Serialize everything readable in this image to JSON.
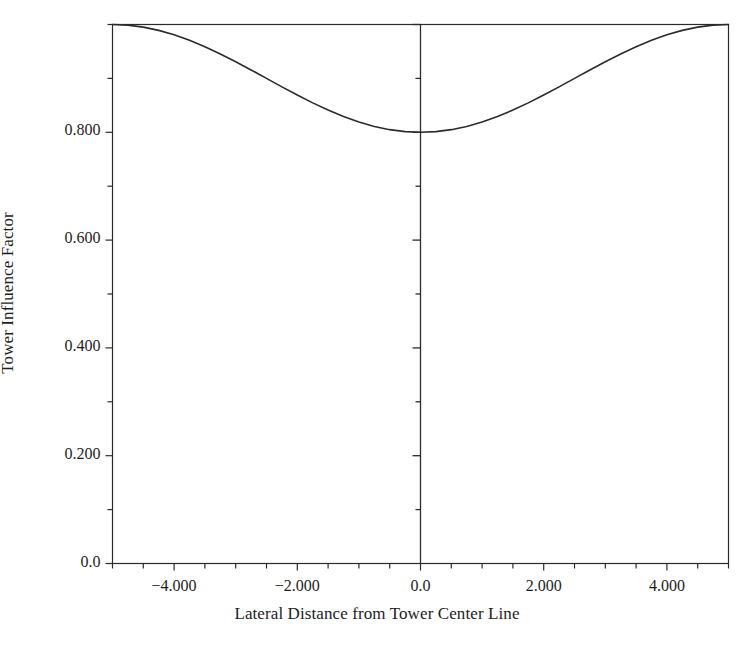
{
  "chart_data": {
    "type": "line",
    "title": "",
    "xlabel": "Lateral Distance from Tower Center Line",
    "ylabel": "Tower Influence Factor",
    "xlim": [
      -5.0,
      5.0
    ],
    "ylim": [
      0.0,
      1.0
    ],
    "grid": false,
    "legend": null,
    "xticks": [
      -5.0,
      -4.5,
      -4.0,
      -3.5,
      -3.0,
      -2.5,
      -2.0,
      -1.5,
      -1.0,
      -0.5,
      0.0,
      0.5,
      1.0,
      1.5,
      2.0,
      2.5,
      3.0,
      3.5,
      4.0,
      4.5,
      5.0
    ],
    "xtick_labels": [
      {
        "value": -4.0,
        "text": "−4.000"
      },
      {
        "value": -2.0,
        "text": "−2.000"
      },
      {
        "value": 0.0,
        "text": "0.0"
      },
      {
        "value": 2.0,
        "text": "2.000"
      },
      {
        "value": 4.0,
        "text": "4.000"
      }
    ],
    "yticks": [
      0.0,
      0.1,
      0.2,
      0.3,
      0.4,
      0.5,
      0.6,
      0.7,
      0.8,
      0.9,
      1.0
    ],
    "ytick_labels": [
      {
        "value": 0.0,
        "text": "0.0"
      },
      {
        "value": 0.2,
        "text": "0.200"
      },
      {
        "value": 0.4,
        "text": "0.400"
      },
      {
        "value": 0.6,
        "text": "0.600"
      },
      {
        "value": 0.8,
        "text": "0.800"
      }
    ],
    "series": [
      {
        "name": "Tower Influence Factor",
        "color": "#2b2b2b",
        "line_width": 1.6,
        "formula": "f(x) = 0.9 - 0.1*cos(pi*x/5)",
        "x": [
          -5.0,
          -4.75,
          -4.5,
          -4.25,
          -4.0,
          -3.75,
          -3.5,
          -3.25,
          -3.0,
          -2.75,
          -2.5,
          -2.25,
          -2.0,
          -1.75,
          -1.5,
          -1.25,
          -1.0,
          -0.75,
          -0.5,
          -0.25,
          0.0,
          0.25,
          0.5,
          0.75,
          1.0,
          1.25,
          1.5,
          1.75,
          2.0,
          2.25,
          2.5,
          2.75,
          3.0,
          3.25,
          3.5,
          3.75,
          4.0,
          4.25,
          4.5,
          4.75,
          5.0
        ],
        "y": [
          1.0,
          0.9988,
          0.9951,
          0.9891,
          0.9809,
          0.9707,
          0.9588,
          0.9454,
          0.9309,
          0.9157,
          0.9,
          0.8843,
          0.8691,
          0.8546,
          0.8412,
          0.8293,
          0.8191,
          0.8109,
          0.8049,
          0.8012,
          0.8,
          0.8012,
          0.8049,
          0.8109,
          0.8191,
          0.8293,
          0.8412,
          0.8546,
          0.8691,
          0.8843,
          0.9,
          0.9157,
          0.9309,
          0.9454,
          0.9588,
          0.9707,
          0.9809,
          0.9891,
          0.9951,
          0.9988,
          1.0
        ]
      }
    ],
    "center_line": {
      "name": "tower-center-line",
      "x": 0.0,
      "y_from": 0.0,
      "y_to": 1.0,
      "color": "#2b2b2b",
      "ticks": [
        0.1,
        0.2,
        0.3,
        0.4,
        0.5,
        0.6,
        0.7,
        0.8,
        0.9,
        1.0
      ]
    },
    "frame": {
      "color": "#2b2b2b",
      "top": true,
      "bottom": true,
      "left": true,
      "right": true
    }
  },
  "colors": {
    "background": "#ffffff",
    "axis": "#2b2b2b",
    "curve": "#2b2b2b",
    "text": "#1d1d1d"
  }
}
